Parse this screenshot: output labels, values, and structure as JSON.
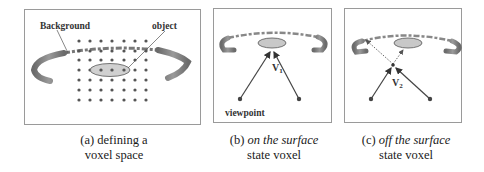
{
  "figure": {
    "panels": [
      {
        "id": "a",
        "labels": {
          "background": "Background",
          "object": "object"
        },
        "caption": {
          "prefix": "(a) defining a",
          "line2": "voxel space"
        },
        "grid": {
          "columns": 7,
          "rows": 6
        }
      },
      {
        "id": "b",
        "labels": {
          "voxel": "V",
          "voxel_sub": "1",
          "viewpoint": "viewpoint"
        },
        "caption": {
          "prefix": "(b) ",
          "italic": "on the surface",
          "line2": "state voxel"
        }
      },
      {
        "id": "c",
        "labels": {
          "voxel": "V",
          "voxel_sub": "2"
        },
        "caption": {
          "prefix": "(c) ",
          "italic": "off the surface",
          "line2": "state voxel"
        }
      }
    ],
    "colors": {
      "border": "#9a9a9a",
      "object_fill": "#c8c8c8",
      "object_stroke": "#555555",
      "dot": "#555555",
      "ray": "#444444",
      "background_ring": "#7a7a7a"
    }
  }
}
